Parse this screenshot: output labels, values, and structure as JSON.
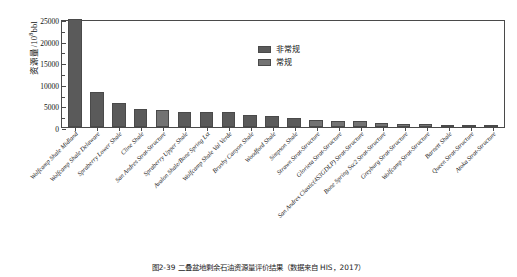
{
  "chart_data": {
    "type": "bar",
    "title": "",
    "xlabel": "",
    "ylabel": "资源量/10⁸bbl",
    "ylabel_main": "资源量/10",
    "ylabel_exp": "8",
    "ylabel_unit": "bbl",
    "ylim": [
      0,
      25000
    ],
    "yticks": [
      0,
      5000,
      10000,
      15000,
      20000,
      25000
    ],
    "ytick_labels": [
      "0",
      "5000",
      "10000",
      "15000",
      "20000",
      "25000"
    ],
    "grid": false,
    "legend_position": "upper-center",
    "categories": [
      "Wolfcamp Shale Midland",
      "Wolfcamp Shale Delaware",
      "Spraberry Lower Shale",
      "Cline Shale",
      "San Andres Strat-Structure",
      "Spraberry Upper Shale",
      "Avalon Shale/Bone Spring Lst",
      "Wolfcamp Shale Val Verde",
      "Brushy Canyon Shale",
      "Woodford Shale",
      "Simpson Shale",
      "Strawn Strat-Structure",
      "Glorieta Strat-Structure",
      "San Andres Clastic(4S3GDLP) Strat-Structure",
      "Bone Spring Ssc2 Strat-Structure",
      "Greyburg Strat-Structure",
      "Wolfcamp Strat-Structure",
      "Barnett Shale",
      "Queen Strat-Structure",
      "Atoka Strat-Structure"
    ],
    "values": [
      25000,
      8100,
      5600,
      4100,
      3950,
      3550,
      3400,
      3400,
      2750,
      2550,
      2150,
      1650,
      1500,
      1400,
      900,
      750,
      700,
      500,
      350,
      300
    ],
    "series": [
      {
        "name": "非常规",
        "color": "#5a5a5a",
        "values": [
          25000,
          8100,
          5600,
          4100,
          0,
          3550,
          3400,
          3400,
          2750,
          2550,
          2150,
          0,
          0,
          0,
          0,
          0,
          0,
          500,
          0,
          0
        ]
      },
      {
        "name": "常规",
        "color": "#737373",
        "values": [
          0,
          0,
          0,
          0,
          3950,
          0,
          0,
          0,
          0,
          0,
          0,
          1650,
          1500,
          1400,
          900,
          750,
          700,
          0,
          350,
          300
        ]
      }
    ]
  },
  "legend": {
    "items": [
      {
        "label": "非常规",
        "color": "#5a5a5a"
      },
      {
        "label": "常规",
        "color": "#737373"
      }
    ]
  },
  "caption": {
    "text": "图2-39  二叠盆地剩余石油资源量评价结果（数据来自 HIS，2017）"
  }
}
